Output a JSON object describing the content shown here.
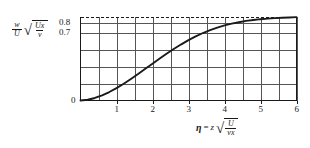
{
  "figure": {
    "background_color": "#ffffff",
    "ink_color": "#1a1a1a",
    "grid_color": "#555555"
  },
  "axis_labels": {
    "y": {
      "fraction_numerator": "w",
      "fraction_denominator": "U",
      "radical_numerator": "Ux",
      "radical_denominator": "v",
      "radical_sign": "√"
    },
    "x": {
      "eta_symbol": "η",
      "equals": "=",
      "variable": "z",
      "radical_numerator": "U",
      "radical_denominator": "vx",
      "radical_sign": "√"
    }
  },
  "chart_data": {
    "type": "line",
    "title": "",
    "xlabel": "eta = z sqrt(U / (v x))",
    "ylabel": "(w / U) sqrt(U x / v)",
    "xlim": [
      0,
      6
    ],
    "ylim": [
      0,
      0.8625
    ],
    "grid": true,
    "legend": null,
    "xticks": [
      1,
      2,
      3,
      4,
      5,
      6
    ],
    "xtick_labels": [
      "1",
      "2",
      "3",
      "4",
      "5",
      "6"
    ],
    "xminor_grid_step": 0.5,
    "yticks": [
      0,
      0.7,
      0.8
    ],
    "ytick_labels": [
      "0",
      "0.7",
      "0.8"
    ],
    "ygridlines": [
      0.1725,
      0.345,
      0.5175,
      0.69,
      0.8
    ],
    "asymptote": {
      "value": 0.8625,
      "style": "dashed",
      "label": ""
    },
    "x": [
      0.0,
      0.2,
      0.4,
      0.6,
      0.8,
      1.0,
      1.2,
      1.4,
      1.6,
      1.8,
      2.0,
      2.2,
      2.4,
      2.6,
      2.8,
      3.0,
      3.2,
      3.4,
      3.6,
      3.8,
      4.0,
      4.2,
      4.4,
      4.6,
      4.8,
      5.0,
      5.2,
      5.4,
      5.6,
      5.8,
      6.0
    ],
    "y": [
      0.0,
      0.008,
      0.026,
      0.053,
      0.087,
      0.127,
      0.172,
      0.221,
      0.272,
      0.325,
      0.378,
      0.431,
      0.482,
      0.531,
      0.577,
      0.62,
      0.658,
      0.693,
      0.723,
      0.749,
      0.771,
      0.789,
      0.804,
      0.817,
      0.827,
      0.835,
      0.841,
      0.846,
      0.85,
      0.853,
      0.856
    ],
    "series": [
      {
        "name": "vertical velocity profile",
        "values": [
          0.0,
          0.008,
          0.026,
          0.053,
          0.087,
          0.127,
          0.172,
          0.221,
          0.272,
          0.325,
          0.378,
          0.431,
          0.482,
          0.531,
          0.577,
          0.62,
          0.658,
          0.693,
          0.723,
          0.749,
          0.771,
          0.789,
          0.804,
          0.817,
          0.827,
          0.835,
          0.841,
          0.846,
          0.85,
          0.853,
          0.856
        ]
      }
    ]
  }
}
